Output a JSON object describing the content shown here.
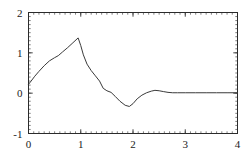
{
  "figure": {
    "background_color": "#ffffff",
    "frame_color": "#2b2b2b",
    "curve_color": "#3a3a3a"
  },
  "chart_data": {
    "type": "line",
    "title": "",
    "subtitle": "",
    "xlabel": "",
    "ylabel": "",
    "xlim": [
      0,
      4
    ],
    "ylim": [
      -1,
      2
    ],
    "grid": false,
    "legend": null,
    "frame": true,
    "minor_ticks": true,
    "x_ticks": [
      0,
      1,
      2,
      3,
      4
    ],
    "x_tick_labels": [
      "0",
      "1",
      "2",
      "3",
      "4"
    ],
    "y_ticks": [
      -1,
      0,
      1,
      2
    ],
    "y_tick_labels": [
      "-1",
      "0",
      "1",
      "2"
    ],
    "x_minor_step": 0.1,
    "y_minor_step": 0.1,
    "series": [
      {
        "name": "signal",
        "color": "#3a3a3a",
        "x": [
          0.0,
          0.05,
          0.12,
          0.2,
          0.3,
          0.4,
          0.5,
          0.57,
          0.65,
          0.75,
          0.85,
          0.95,
          1.0,
          1.05,
          1.12,
          1.2,
          1.28,
          1.36,
          1.43,
          1.5,
          1.58,
          1.66,
          1.75,
          1.85,
          1.93,
          2.0,
          2.08,
          2.17,
          2.26,
          2.35,
          2.42,
          2.5,
          2.58,
          2.67,
          2.76,
          2.85,
          3.0,
          3.2,
          3.4,
          3.6,
          3.8,
          4.0
        ],
        "y": [
          0.22,
          0.3,
          0.42,
          0.54,
          0.68,
          0.8,
          0.88,
          0.93,
          1.02,
          1.13,
          1.25,
          1.37,
          1.18,
          0.95,
          0.72,
          0.56,
          0.43,
          0.3,
          0.12,
          0.06,
          0.02,
          -0.08,
          -0.2,
          -0.3,
          -0.33,
          -0.26,
          -0.14,
          -0.05,
          0.01,
          0.05,
          0.07,
          0.06,
          0.04,
          0.02,
          0.01,
          0.01,
          0.01,
          0.01,
          0.01,
          0.01,
          0.01,
          0.01
        ]
      }
    ]
  }
}
